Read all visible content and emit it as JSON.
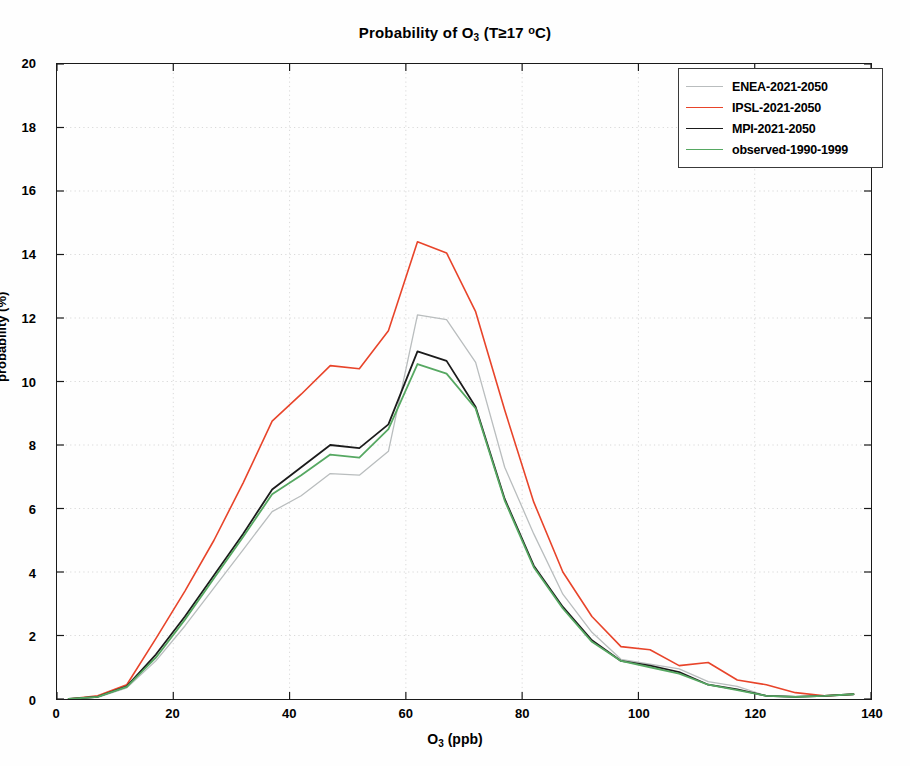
{
  "chart_data": {
    "type": "line",
    "title_parts": {
      "prefix": "Probability of O",
      "sub": "3",
      "suffix": " (T≥17 ",
      "deg": "o",
      "unit": "C)"
    },
    "xlabel": "O3 (ppb)",
    "xlabel_parts": {
      "prefix": "O",
      "sub": "3",
      "suffix": " (ppb)"
    },
    "ylabel": "probability (%)",
    "xlim": [
      0,
      140
    ],
    "ylim": [
      0,
      20
    ],
    "xticks": [
      0,
      20,
      40,
      60,
      80,
      100,
      120,
      140
    ],
    "yticks": [
      0,
      2,
      4,
      6,
      8,
      10,
      12,
      14,
      16,
      18,
      20
    ],
    "grid": true,
    "legend_position": "top-right",
    "x": [
      2,
      7,
      12,
      17,
      22,
      27,
      32,
      37,
      42,
      47,
      52,
      57,
      62,
      67,
      72,
      77,
      82,
      87,
      92,
      97,
      102,
      107,
      112,
      117,
      122,
      127,
      132,
      137
    ],
    "series": [
      {
        "name": "ENEA-2021-2050",
        "color": "#b9bdbe",
        "width": 1.3,
        "values": [
          0.0,
          0.05,
          0.35,
          1.2,
          2.3,
          3.5,
          4.7,
          5.9,
          6.4,
          7.1,
          7.05,
          7.8,
          12.1,
          11.95,
          10.6,
          7.3,
          5.2,
          3.3,
          2.1,
          1.25,
          1.1,
          0.95,
          0.55,
          0.4,
          0.1,
          0.08,
          0.1,
          0.15
        ]
      },
      {
        "name": "IPSL-2021-2050",
        "color": "#e8442a",
        "width": 1.6,
        "values": [
          0.0,
          0.1,
          0.45,
          1.9,
          3.4,
          5.0,
          6.8,
          8.75,
          9.6,
          10.5,
          10.4,
          11.6,
          14.4,
          14.05,
          12.2,
          9.1,
          6.2,
          4.0,
          2.6,
          1.65,
          1.55,
          1.05,
          1.15,
          0.6,
          0.45,
          0.2,
          0.1,
          0.15
        ]
      },
      {
        "name": "MPI-2021-2050",
        "color": "#1b1b1b",
        "width": 1.8,
        "values": [
          0.0,
          0.07,
          0.4,
          1.4,
          2.6,
          3.9,
          5.2,
          6.6,
          7.3,
          8.0,
          7.9,
          8.65,
          10.95,
          10.65,
          9.2,
          6.3,
          4.2,
          2.9,
          1.85,
          1.2,
          1.05,
          0.85,
          0.45,
          0.3,
          0.1,
          0.07,
          0.1,
          0.15
        ]
      },
      {
        "name": "observed-1990-1999",
        "color": "#56a862",
        "width": 1.8,
        "values": [
          0.0,
          0.07,
          0.38,
          1.3,
          2.5,
          3.8,
          5.1,
          6.45,
          7.05,
          7.7,
          7.6,
          8.5,
          10.55,
          10.25,
          9.15,
          6.25,
          4.15,
          2.85,
          1.8,
          1.2,
          1.0,
          0.8,
          0.45,
          0.28,
          0.1,
          0.07,
          0.1,
          0.15
        ]
      }
    ]
  }
}
